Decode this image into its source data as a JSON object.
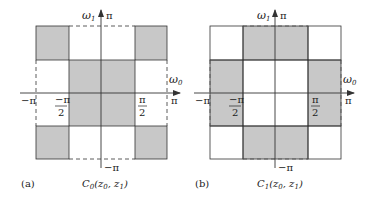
{
  "figure": {
    "fill_color": "#c8c8c8",
    "line_color": "#333333",
    "panels": [
      {
        "id": "a",
        "tag": "(a)",
        "caption": "C0(z0, z1)",
        "caption_parts": {
          "C": "C",
          "sub": "0",
          "args_open": "(z",
          "a1sub": "0",
          "comma": ", z",
          "a2sub": "1",
          "close": ")"
        },
        "axis_labels": {
          "w1": "ω",
          "w1_sub": "1",
          "w0": "ω",
          "w0_sub": "0",
          "pi_top": "π",
          "pi_right": "π",
          "neg_pi_left": "−π",
          "neg_pi_bottom": "−π",
          "neg_half_num": "−π",
          "neg_half_den": "2",
          "pos_half_num": "π",
          "pos_half_den": "2"
        },
        "shaded_cells": [
          [
            0,
            0
          ],
          [
            0,
            3
          ],
          [
            1,
            1
          ],
          [
            1,
            2
          ],
          [
            2,
            1
          ],
          [
            2,
            2
          ],
          [
            3,
            0
          ],
          [
            3,
            3
          ]
        ],
        "grid": "4x4 over [-π, π] × [-π, π]"
      },
      {
        "id": "b",
        "tag": "(b)",
        "caption": "C1(z0, z1)",
        "caption_parts": {
          "C": "C",
          "sub": "1",
          "args_open": "(z",
          "a1sub": "0",
          "comma": ", z",
          "a2sub": "1",
          "close": ")"
        },
        "axis_labels": {
          "w1": "ω",
          "w1_sub": "1",
          "w0": "ω",
          "w0_sub": "0",
          "pi_top": "π",
          "pi_right": "π",
          "neg_pi_left": "−π",
          "neg_pi_bottom": "−π",
          "neg_half_num": "−π",
          "neg_half_den": "2",
          "pos_half_num": "π",
          "pos_half_den": "2"
        },
        "shaded_cells": [
          [
            0,
            1
          ],
          [
            0,
            2
          ],
          [
            1,
            0
          ],
          [
            1,
            3
          ],
          [
            2,
            0
          ],
          [
            2,
            3
          ],
          [
            3,
            1
          ],
          [
            3,
            2
          ]
        ],
        "grid": "4x4 over [-π, π] × [-π, π]"
      }
    ]
  }
}
